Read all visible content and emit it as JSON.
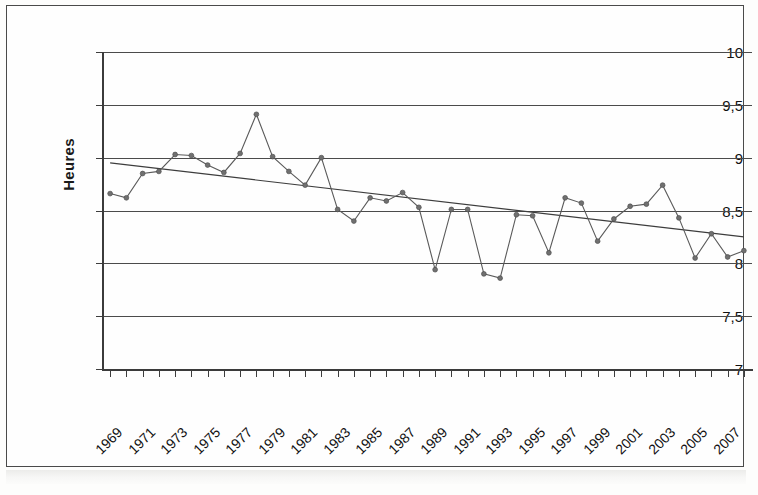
{
  "chart_data": {
    "type": "line",
    "title": "",
    "subtitle": "",
    "xlabel": "",
    "ylabel": "Heures",
    "xlim": [
      1968.5,
      2008.5
    ],
    "ylim": [
      7,
      10
    ],
    "grid": true,
    "legend": "none",
    "y_ticks": [
      "7",
      "7,5",
      "8",
      "8,5",
      "9",
      "9,5",
      "10"
    ],
    "y_tick_values": [
      7,
      7.5,
      8,
      8.5,
      9,
      9.5,
      10
    ],
    "x_tick_labels": [
      "1969",
      "1971",
      "1973",
      "1975",
      "1977",
      "1979",
      "1981",
      "1983",
      "1985",
      "1987",
      "1989",
      "1991",
      "1993",
      "1995",
      "1997",
      "1999",
      "2001",
      "2003",
      "2005",
      "2007"
    ],
    "x": [
      1969,
      1970,
      1971,
      1972,
      1973,
      1974,
      1975,
      1976,
      1977,
      1978,
      1979,
      1980,
      1981,
      1982,
      1983,
      1984,
      1985,
      1986,
      1987,
      1988,
      1989,
      1990,
      1991,
      1992,
      1993,
      1994,
      1995,
      1996,
      1997,
      1998,
      1999,
      2000,
      2001,
      2002,
      2003,
      2004,
      2005,
      2006,
      2007,
      2008
    ],
    "series": [
      {
        "name": "Heures",
        "style": "line-with-markers",
        "color": "#5a5a5a",
        "values": [
          8.66,
          8.62,
          8.85,
          8.87,
          9.03,
          9.02,
          8.93,
          8.86,
          9.04,
          9.41,
          9.01,
          8.87,
          8.74,
          9.0,
          8.51,
          8.4,
          8.62,
          8.59,
          8.67,
          8.53,
          7.94,
          8.51,
          8.51,
          7.9,
          7.86,
          8.46,
          8.45,
          8.1,
          8.62,
          8.57,
          8.21,
          8.42,
          8.54,
          8.56,
          8.74,
          8.43,
          8.05,
          8.28,
          8.06,
          8.12
        ]
      },
      {
        "name": "Tendance linéaire",
        "style": "trend-line",
        "color": "#3d3d3d",
        "endpoints": [
          {
            "x": 1969,
            "y": 8.95
          },
          {
            "x": 2008,
            "y": 8.25
          }
        ]
      }
    ]
  },
  "axes": {
    "y_axis_title": "Heures"
  }
}
